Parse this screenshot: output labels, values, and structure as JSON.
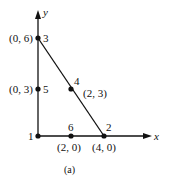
{
  "figure": {
    "caption": "(a)",
    "axes": {
      "x_label": "x",
      "y_label": "y"
    },
    "nodes": [
      {
        "id": "1",
        "label": "1",
        "coord": "",
        "x": 0,
        "y": 0
      },
      {
        "id": "2",
        "label": "2",
        "coord": "(4, 0)",
        "x": 4,
        "y": 0
      },
      {
        "id": "3",
        "label": "3",
        "coord": "(0, 6)",
        "x": 0,
        "y": 6
      },
      {
        "id": "4",
        "label": "4",
        "coord": "(2, 3)",
        "x": 2,
        "y": 3
      },
      {
        "id": "5",
        "label": "5",
        "coord": "(0, 3)",
        "x": 0,
        "y": 3
      },
      {
        "id": "6",
        "label": "6",
        "coord": "(2, 0)",
        "x": 2,
        "y": 0
      }
    ],
    "edges": [
      {
        "from": "1",
        "to": "3"
      },
      {
        "from": "1",
        "to": "2"
      },
      {
        "from": "3",
        "to": "2"
      }
    ],
    "colors": {
      "ink": "#111111",
      "background": "#ffffff"
    }
  }
}
